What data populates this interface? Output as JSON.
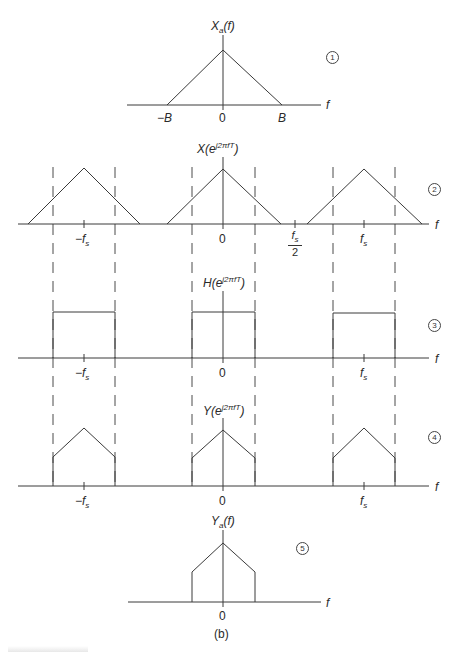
{
  "figure": {
    "subfigure_label": "(b)",
    "panels": [
      {
        "id": 1,
        "circle_label": "1",
        "title_main": "X",
        "title_sub": "a",
        "title_tail": "(f)",
        "axis_var": "f",
        "ticks": [
          {
            "label_prefix": "−",
            "label": "B"
          },
          {
            "label_prefix": "",
            "label": "0"
          },
          {
            "label_prefix": "",
            "label": "B"
          }
        ],
        "shape": "triangle"
      },
      {
        "id": 2,
        "circle_label": "2",
        "title_main": "X(e",
        "title_sup": "j2πfT",
        "title_tail": ")",
        "axis_var": "f",
        "ticks": [
          {
            "label_prefix": "−f",
            "sub": "s"
          },
          {
            "label": "0"
          },
          {
            "frac_num": "f",
            "frac_num_sub": "s",
            "frac_den": "2"
          },
          {
            "label_prefix": "f",
            "sub": "s"
          }
        ],
        "shape": "periodic triangles"
      },
      {
        "id": 3,
        "circle_label": "3",
        "title_main": "H(e",
        "title_sup": "j2πfT",
        "title_tail": ")",
        "axis_var": "f",
        "ticks": [
          {
            "label_prefix": "−f",
            "sub": "s"
          },
          {
            "label": "0"
          },
          {
            "label_prefix": "f",
            "sub": "s"
          }
        ],
        "shape": "periodic rectangles (ideal lowpass)"
      },
      {
        "id": 4,
        "circle_label": "4",
        "title_main": "Y(e",
        "title_sup": "j2πfT",
        "title_tail": ")",
        "axis_var": "f",
        "ticks": [
          {
            "label_prefix": "−f",
            "sub": "s"
          },
          {
            "label": "0"
          },
          {
            "label_prefix": "f",
            "sub": "s"
          }
        ],
        "shape": "periodic truncated triangles"
      },
      {
        "id": 5,
        "circle_label": "5",
        "title_main": "Y",
        "title_sub": "a",
        "title_tail": "(f)",
        "axis_var": "f",
        "ticks": [
          {
            "label": "0"
          }
        ],
        "shape": "truncated triangle"
      }
    ],
    "colors": {
      "line": "#3a3a3a",
      "text": "#2a2a2a",
      "background": "#ffffff"
    }
  }
}
